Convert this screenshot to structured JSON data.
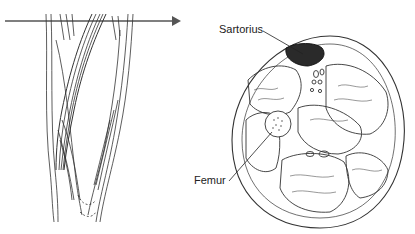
{
  "figure": {
    "labels": {
      "sartorius": "Sartorius",
      "femur": "Femur"
    },
    "colors": {
      "line": "#333333",
      "sartorius_fill": "#2a2a2a",
      "arrow": "#555555",
      "background": "#ffffff"
    }
  }
}
